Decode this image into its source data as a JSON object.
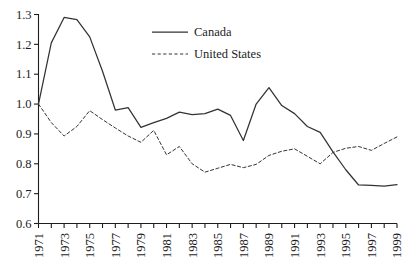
{
  "chart_data": {
    "type": "line",
    "title": "",
    "subtitle": "",
    "xlabel": "",
    "ylabel": "",
    "xlim": [
      1971,
      1999
    ],
    "ylim": [
      0.6,
      1.3
    ],
    "grid": false,
    "legend_position": "top-center",
    "x": [
      1971,
      1972,
      1973,
      1974,
      1975,
      1976,
      1977,
      1978,
      1979,
      1980,
      1981,
      1982,
      1983,
      1984,
      1985,
      1986,
      1987,
      1988,
      1989,
      1990,
      1991,
      1992,
      1993,
      1994,
      1995,
      1996,
      1997,
      1998,
      1999
    ],
    "series": [
      {
        "name": "Canada",
        "style": "solid",
        "color": "#333333",
        "values": [
          1.0,
          1.205,
          1.29,
          1.283,
          1.225,
          1.11,
          0.98,
          0.988,
          0.922,
          0.938,
          0.952,
          0.973,
          0.965,
          0.968,
          0.983,
          0.962,
          0.878,
          1.0,
          1.055,
          0.995,
          0.968,
          0.925,
          0.905,
          0.84,
          0.78,
          0.729,
          0.728,
          0.725,
          0.73
        ]
      },
      {
        "name": "United States",
        "style": "dashed",
        "color": "#333333",
        "values": [
          1.0,
          0.938,
          0.893,
          0.925,
          0.978,
          0.948,
          0.92,
          0.893,
          0.872,
          0.912,
          0.83,
          0.858,
          0.8,
          0.772,
          0.785,
          0.798,
          0.787,
          0.798,
          0.828,
          0.842,
          0.85,
          0.825,
          0.8,
          0.838,
          0.852,
          0.858,
          0.845,
          0.868,
          0.89
        ]
      }
    ],
    "y_ticks": [
      "0.6",
      "0.7",
      "0.8",
      "0.9",
      "1.0",
      "1.1",
      "1.2",
      "1.3"
    ],
    "y_tick_values": [
      0.6,
      0.7,
      0.8,
      0.9,
      1.0,
      1.1,
      1.2,
      1.3
    ],
    "x_tick_values": [
      1971,
      1972,
      1973,
      1974,
      1975,
      1976,
      1977,
      1978,
      1979,
      1980,
      1981,
      1982,
      1983,
      1984,
      1985,
      1986,
      1987,
      1988,
      1989,
      1990,
      1991,
      1992,
      1993,
      1994,
      1995,
      1996,
      1997,
      1998,
      1999
    ],
    "x_tick_labels": [
      "1971",
      "",
      "1973",
      "",
      "1975",
      "",
      "1977",
      "",
      "1979",
      "",
      "1981",
      "",
      "1983",
      "",
      "1985",
      "",
      "1987",
      "",
      "1989",
      "",
      "1991",
      "",
      "1993",
      "",
      "1995",
      "",
      "1997",
      "",
      "1999"
    ]
  },
  "legend": {
    "entries": [
      {
        "label": "Canada",
        "style": "solid"
      },
      {
        "label": "United States",
        "style": "dashed"
      }
    ]
  },
  "caption": {
    "text": ""
  }
}
